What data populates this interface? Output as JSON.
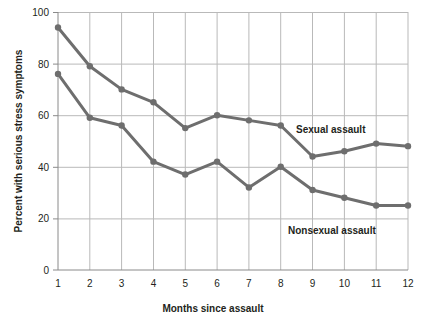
{
  "chart_data": {
    "type": "line",
    "title": "",
    "xlabel": "Months since assault",
    "ylabel": "Percent with serious stress symptoms",
    "x": [
      1,
      2,
      3,
      4,
      5,
      6,
      7,
      8,
      9,
      10,
      11,
      12
    ],
    "xticklabels": [
      "1",
      "2",
      "3",
      "4",
      "5",
      "6",
      "7",
      "8",
      "9",
      "10",
      "11",
      "12"
    ],
    "yticklabels": [
      "0",
      "20",
      "40",
      "60",
      "80",
      "100"
    ],
    "yticks": [
      0,
      20,
      40,
      60,
      80,
      100
    ],
    "xlim": [
      1,
      12
    ],
    "ylim": [
      0,
      100
    ],
    "grid": true,
    "legend_position": "inline-annotations",
    "series": [
      {
        "name": "Sexual assault",
        "color": "#6e6e6e",
        "values": [
          94,
          79,
          70,
          65,
          55,
          60,
          58,
          56,
          44,
          46,
          49,
          48
        ],
        "annotation": "Sexual assault"
      },
      {
        "name": "Nonsexual assault",
        "color": "#6e6e6e",
        "values": [
          76,
          59,
          56,
          42,
          37,
          42,
          32,
          40,
          31,
          28,
          25,
          25
        ],
        "annotation": "Nonsexual assault"
      }
    ]
  },
  "figure": {
    "xlabel": "Months since assault",
    "ylabel": "Percent with serious stress symptoms",
    "series_label_sexual": "Sexual assault",
    "series_label_nonsexual": "Nonsexual assault",
    "ytick_0": "0",
    "ytick_20": "20",
    "ytick_40": "40",
    "ytick_60": "60",
    "ytick_80": "80",
    "ytick_100": "100",
    "xtick_1": "1",
    "xtick_2": "2",
    "xtick_3": "3",
    "xtick_4": "4",
    "xtick_5": "5",
    "xtick_6": "6",
    "xtick_7": "7",
    "xtick_8": "8",
    "xtick_9": "9",
    "xtick_10": "10",
    "xtick_11": "11",
    "xtick_12": "12"
  },
  "style": {
    "line_color": "#6e6e6e",
    "grid_color": "#b9b9b9",
    "axis_color": "#8a8a8a",
    "text_color": "#231f20",
    "background": "#ffffff"
  }
}
